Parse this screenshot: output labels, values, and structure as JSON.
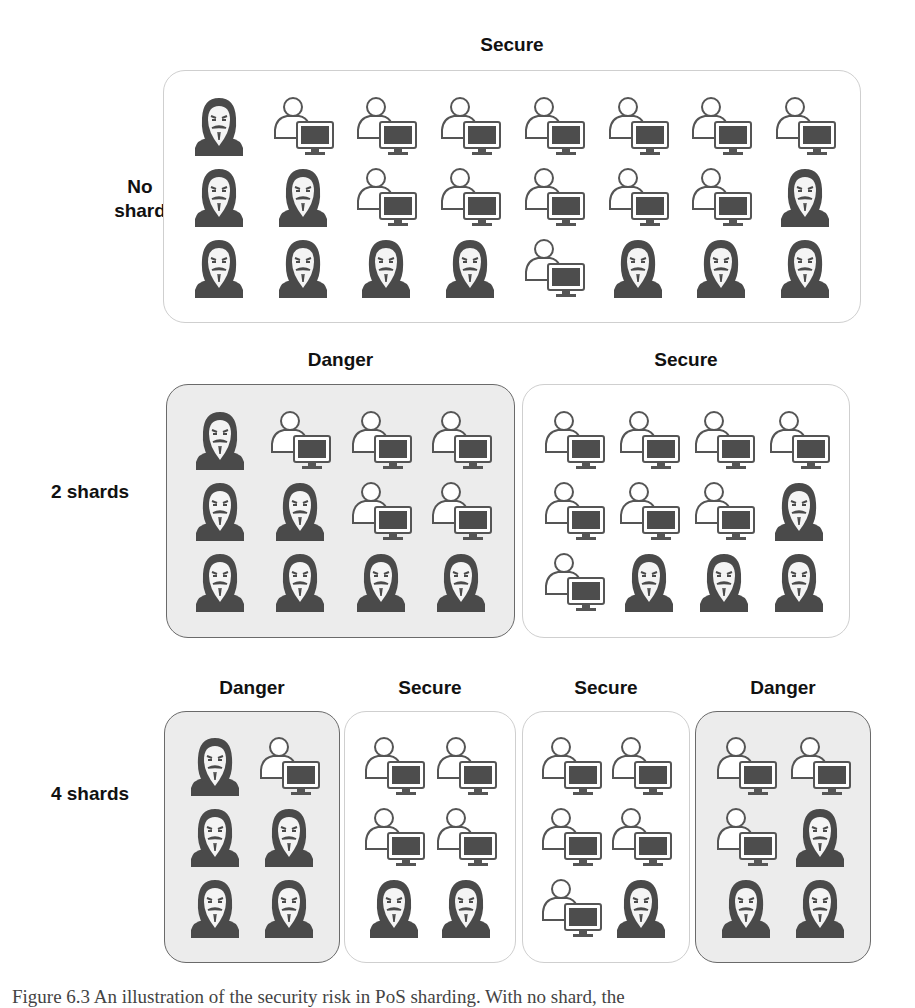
{
  "legend_icons": {
    "malicious": "hacker-icon",
    "honest": "user-computer-icon"
  },
  "rows": [
    {
      "label": "No shard",
      "shards": [
        {
          "status": "Secure",
          "kind": "secure",
          "nodes": [
            [
              "malicious",
              "honest",
              "honest",
              "honest",
              "honest",
              "honest",
              "honest",
              "honest"
            ],
            [
              "malicious",
              "malicious",
              "honest",
              "honest",
              "honest",
              "honest",
              "honest",
              "malicious"
            ],
            [
              "malicious",
              "malicious",
              "malicious",
              "malicious",
              "honest",
              "malicious",
              "malicious",
              "malicious"
            ]
          ]
        }
      ]
    },
    {
      "label": "2 shards",
      "shards": [
        {
          "status": "Danger",
          "kind": "danger",
          "nodes": [
            [
              "malicious",
              "honest",
              "honest",
              "honest"
            ],
            [
              "malicious",
              "malicious",
              "honest",
              "honest"
            ],
            [
              "malicious",
              "malicious",
              "malicious",
              "malicious"
            ]
          ]
        },
        {
          "status": "Secure",
          "kind": "secure",
          "nodes": [
            [
              "honest",
              "honest",
              "honest",
              "honest"
            ],
            [
              "honest",
              "honest",
              "honest",
              "malicious"
            ],
            [
              "honest",
              "malicious",
              "malicious",
              "malicious"
            ]
          ]
        }
      ]
    },
    {
      "label": "4 shards",
      "shards": [
        {
          "status": "Danger",
          "kind": "danger",
          "nodes": [
            [
              "malicious",
              "honest"
            ],
            [
              "malicious",
              "malicious"
            ],
            [
              "malicious",
              "malicious"
            ]
          ]
        },
        {
          "status": "Secure",
          "kind": "secure",
          "nodes": [
            [
              "honest",
              "honest"
            ],
            [
              "honest",
              "honest"
            ],
            [
              "malicious",
              "malicious"
            ]
          ]
        },
        {
          "status": "Secure",
          "kind": "secure",
          "nodes": [
            [
              "honest",
              "honest"
            ],
            [
              "honest",
              "honest"
            ],
            [
              "honest",
              "malicious"
            ]
          ]
        },
        {
          "status": "Danger",
          "kind": "danger",
          "nodes": [
            [
              "honest",
              "honest"
            ],
            [
              "honest",
              "malicious"
            ],
            [
              "malicious",
              "malicious"
            ]
          ]
        }
      ]
    }
  ],
  "caption": "Figure 6.3 An illustration of the security risk in PoS sharding. With no shard, the"
}
